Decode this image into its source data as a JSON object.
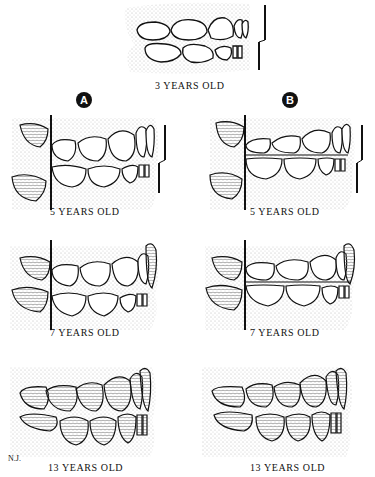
{
  "diagram": {
    "top": {
      "label": "3 YEARS OLD"
    },
    "columns": [
      {
        "badge": "A",
        "panels": [
          {
            "label": "5 YEARS OLD"
          },
          {
            "label": "7 YEARS OLD"
          },
          {
            "label": "13 YEARS OLD"
          }
        ]
      },
      {
        "badge": "B",
        "panels": [
          {
            "label": "5 YEARS OLD"
          },
          {
            "label": "7 YEARS OLD"
          },
          {
            "label": "13 YEARS OLD"
          }
        ]
      }
    ],
    "artist_initials": "N.J.",
    "colors": {
      "ink": "#111111",
      "background": "#ffffff",
      "stipple": "#888888"
    }
  }
}
